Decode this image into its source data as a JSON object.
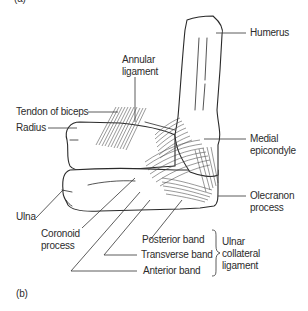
{
  "panels": {
    "top_label": "(a)",
    "bottom_label": "(b)"
  },
  "labels": {
    "humerus": "Humerus",
    "annular_ligament": "Annular\nligament",
    "tendon_of_biceps": "Tendon of biceps",
    "radius": "Radius",
    "medial_epicondyle": "Medial\nepicondyle",
    "ulna": "Ulna",
    "coronoid_process": "Coronoid\nprocess",
    "olecranon_process": "Olecranon\nprocess",
    "posterior_band": "Posterior band",
    "transverse_band": "Transverse band",
    "anterior_band": "Anterior band",
    "ulnar_collateral_ligament": "Ulnar\ncollateral\nligament"
  },
  "colors": {
    "line": "#2a2a2a",
    "text": "#2b2b2b",
    "background": "#ffffff"
  }
}
